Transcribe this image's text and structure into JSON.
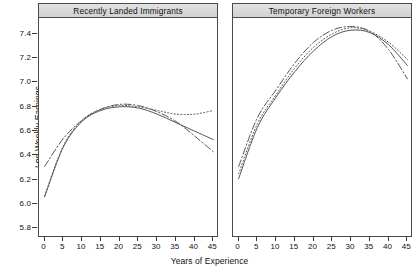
{
  "chart_data": {
    "type": "line",
    "title": "",
    "xlabel": "Years of Experience",
    "ylabel": "Log Weekly Earnings",
    "xlim": [
      -1.5,
      46.5
    ],
    "ylim": [
      5.72,
      7.52
    ],
    "xticks": [
      0,
      5,
      10,
      15,
      20,
      25,
      30,
      35,
      40,
      45
    ],
    "yticks": [
      5.8,
      6.0,
      6.2,
      6.4,
      6.6,
      6.8,
      7.0,
      7.2,
      7.4
    ],
    "grid": false,
    "legend": "none",
    "line_color": "#555555",
    "panels": [
      {
        "name": "Recently Landed Immigrants",
        "x": [
          0,
          5,
          10,
          15,
          20,
          25,
          30,
          35,
          40,
          45
        ],
        "series": [
          {
            "name": "series-solid",
            "style": "solid",
            "values": [
              6.05,
              6.46,
              6.67,
              6.76,
              6.79,
              6.78,
              6.73,
              6.66,
              6.59,
              6.52
            ]
          },
          {
            "name": "series-dashdot",
            "style": "dash-dot",
            "values": [
              6.3,
              6.53,
              6.68,
              6.77,
              6.81,
              6.8,
              6.75,
              6.67,
              6.55,
              6.42
            ]
          },
          {
            "name": "series-dotted",
            "style": "dotted",
            "values": [
              6.06,
              6.47,
              6.68,
              6.77,
              6.8,
              6.79,
              6.76,
              6.73,
              6.73,
              6.76
            ]
          }
        ]
      },
      {
        "name": "Temporary Foreign Workers",
        "x": [
          0,
          5,
          10,
          15,
          20,
          25,
          30,
          35,
          40,
          45
        ],
        "series": [
          {
            "name": "series-solid",
            "style": "solid",
            "values": [
              6.2,
              6.62,
              6.87,
              7.08,
              7.25,
              7.37,
              7.42,
              7.4,
              7.3,
              7.13
            ]
          },
          {
            "name": "series-dashdot",
            "style": "dash-dot",
            "values": [
              6.3,
              6.7,
              6.93,
              7.15,
              7.32,
              7.42,
              7.45,
              7.41,
              7.26,
              7.02
            ]
          },
          {
            "name": "series-dotted",
            "style": "dotted",
            "values": [
              6.24,
              6.65,
              6.89,
              7.11,
              7.28,
              7.39,
              7.44,
              7.41,
              7.32,
              7.18
            ]
          }
        ]
      }
    ]
  },
  "axis": {
    "y_title": "Log Weekly Earnings",
    "x_title": "Years of Experience",
    "y_tick_labels": [
      "7.4",
      "7.2",
      "7.0",
      "6.8",
      "6.6",
      "6.4",
      "6.2",
      "6.0",
      "5.8"
    ],
    "x_tick_labels": [
      "0",
      "5",
      "10",
      "15",
      "20",
      "25",
      "30",
      "35",
      "40",
      "45"
    ]
  },
  "panels": {
    "left_title": "Recently Landed Immigrants",
    "right_title": "Temporary Foreign Workers"
  }
}
